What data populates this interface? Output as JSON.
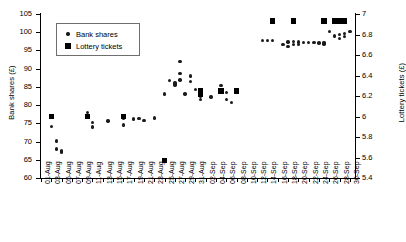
{
  "chart_data": {
    "type": "scatter",
    "title": "",
    "xlabel": "",
    "ylabel": "Bank shares (£)",
    "y2label": "Lottery tickets (£)",
    "ylim": [
      60,
      105
    ],
    "y2lim": [
      5.4,
      7.0
    ],
    "yticks": [
      60,
      65,
      70,
      75,
      80,
      85,
      90,
      95,
      100,
      105
    ],
    "y2ticks": [
      5.4,
      5.6,
      5.8,
      6.0,
      6.2,
      6.4,
      6.6,
      6.8,
      7.0
    ],
    "grid": false,
    "legend_position": "upper left",
    "x_tick_labels": [
      "01-Aug",
      "03-Aug",
      "05-Aug",
      "07-Aug",
      "09-Aug",
      "11-Aug",
      "13-Aug",
      "15-Aug",
      "17-Aug",
      "19-Aug",
      "21-Aug",
      "23-Aug",
      "25-Aug",
      "27-Aug",
      "29-Aug",
      "31-Aug",
      "02-Sep",
      "04-Sep",
      "06-Sep",
      "08-Sep",
      "10-Sep",
      "12-Sep",
      "14-Sep",
      "16-Sep",
      "18-Sep",
      "20-Sep",
      "22-Sep",
      "24-Sep",
      "26-Sep",
      "28-Sep",
      "30-Sep"
    ],
    "x_tick_count": 31,
    "x_domain_days": 61,
    "series": [
      {
        "name": "Bank shares",
        "axis": "left",
        "marker": "circle",
        "color": "#1a1a1a",
        "points": [
          {
            "x": 2,
            "y": 74.1
          },
          {
            "x": 3,
            "y": 70.2
          },
          {
            "x": 3,
            "y": 68.0
          },
          {
            "x": 4,
            "y": 67.4
          },
          {
            "x": 4,
            "y": 67.1
          },
          {
            "x": 9,
            "y": 76.7
          },
          {
            "x": 9,
            "y": 77.9
          },
          {
            "x": 10,
            "y": 75.3
          },
          {
            "x": 10,
            "y": 74.0
          },
          {
            "x": 13,
            "y": 75.6
          },
          {
            "x": 16,
            "y": 76.3
          },
          {
            "x": 16,
            "y": 74.5
          },
          {
            "x": 18,
            "y": 76.2
          },
          {
            "x": 19,
            "y": 76.3
          },
          {
            "x": 20,
            "y": 75.7
          },
          {
            "x": 22,
            "y": 76.5
          },
          {
            "x": 24,
            "y": 83.0
          },
          {
            "x": 25,
            "y": 86.8
          },
          {
            "x": 26,
            "y": 85.5
          },
          {
            "x": 26,
            "y": 86.1
          },
          {
            "x": 27,
            "y": 91.9
          },
          {
            "x": 27,
            "y": 88.6
          },
          {
            "x": 27,
            "y": 86.9
          },
          {
            "x": 28,
            "y": 83.0
          },
          {
            "x": 29,
            "y": 88.0
          },
          {
            "x": 29,
            "y": 86.5
          },
          {
            "x": 30,
            "y": 84.3
          },
          {
            "x": 31,
            "y": 84.3
          },
          {
            "x": 31,
            "y": 83.2
          },
          {
            "x": 31,
            "y": 82.3
          },
          {
            "x": 31,
            "y": 81.5
          },
          {
            "x": 33,
            "y": 82.2
          },
          {
            "x": 35,
            "y": 85.4
          },
          {
            "x": 36,
            "y": 83.4
          },
          {
            "x": 36,
            "y": 81.6
          },
          {
            "x": 37,
            "y": 80.7
          },
          {
            "x": 38,
            "y": 84.0
          },
          {
            "x": 43,
            "y": 97.8
          },
          {
            "x": 44,
            "y": 97.8
          },
          {
            "x": 45,
            "y": 97.8
          },
          {
            "x": 47,
            "y": 96.7
          },
          {
            "x": 48,
            "y": 97.3
          },
          {
            "x": 48,
            "y": 96.1
          },
          {
            "x": 49,
            "y": 96.6
          },
          {
            "x": 49,
            "y": 97.4
          },
          {
            "x": 50,
            "y": 96.6
          },
          {
            "x": 50,
            "y": 97.3
          },
          {
            "x": 51,
            "y": 97.1
          },
          {
            "x": 52,
            "y": 97.2
          },
          {
            "x": 53,
            "y": 97.2
          },
          {
            "x": 54,
            "y": 97.0
          },
          {
            "x": 55,
            "y": 96.8
          },
          {
            "x": 55,
            "y": 97.2
          },
          {
            "x": 56,
            "y": 100.2
          },
          {
            "x": 57,
            "y": 99.0
          },
          {
            "x": 58,
            "y": 99.4
          },
          {
            "x": 58,
            "y": 98.2
          },
          {
            "x": 59,
            "y": 99.6
          },
          {
            "x": 59,
            "y": 98.9
          },
          {
            "x": 60,
            "y": 100.2
          }
        ]
      },
      {
        "name": "Lottery tickets",
        "axis": "right",
        "marker": "square",
        "color": "#000000",
        "points": [
          {
            "x": 2,
            "y": 6.0
          },
          {
            "x": 9,
            "y": 6.0
          },
          {
            "x": 16,
            "y": 6.0
          },
          {
            "x": 24,
            "y": 5.57
          },
          {
            "x": 31,
            "y": 6.25
          },
          {
            "x": 31,
            "y": 6.22
          },
          {
            "x": 35,
            "y": 6.25
          },
          {
            "x": 38,
            "y": 6.25
          },
          {
            "x": 45,
            "y": 6.93
          },
          {
            "x": 49,
            "y": 6.93
          },
          {
            "x": 55,
            "y": 6.93
          },
          {
            "x": 57,
            "y": 6.93
          },
          {
            "x": 58,
            "y": 6.93
          },
          {
            "x": 59,
            "y": 6.93
          }
        ]
      }
    ]
  }
}
